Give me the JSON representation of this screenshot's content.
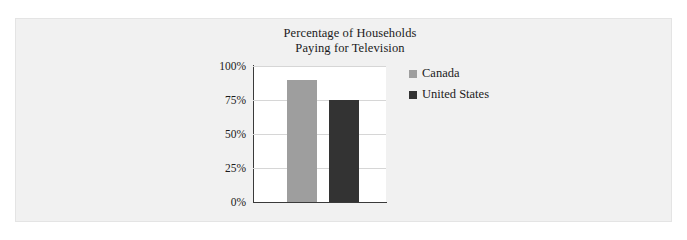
{
  "chart_data": {
    "type": "bar",
    "title": "Percentage of Households\nPaying for Television",
    "title_line1": "Percentage of Households",
    "title_line2": "Paying for Television",
    "xlabel": "",
    "ylabel": "",
    "categories": [
      ""
    ],
    "series": [
      {
        "name": "Canada",
        "values": [
          90
        ],
        "color": "#9e9e9e"
      },
      {
        "name": "United States",
        "values": [
          75
        ],
        "color": "#333333"
      }
    ],
    "ylim": [
      0,
      100
    ],
    "yticks": [
      0,
      25,
      50,
      75,
      100
    ],
    "ytick_labels": [
      "0%",
      "25%",
      "50%",
      "75%",
      "100%"
    ],
    "grid": true,
    "grid_axis": "y",
    "legend_position": "right",
    "legend": [
      "Canada",
      "United States"
    ],
    "plot_background": "#ffffff",
    "panel_background": "#f1f1f1",
    "axis_color": "#3a3a3a",
    "gridline_color": "#d6d6d6"
  }
}
